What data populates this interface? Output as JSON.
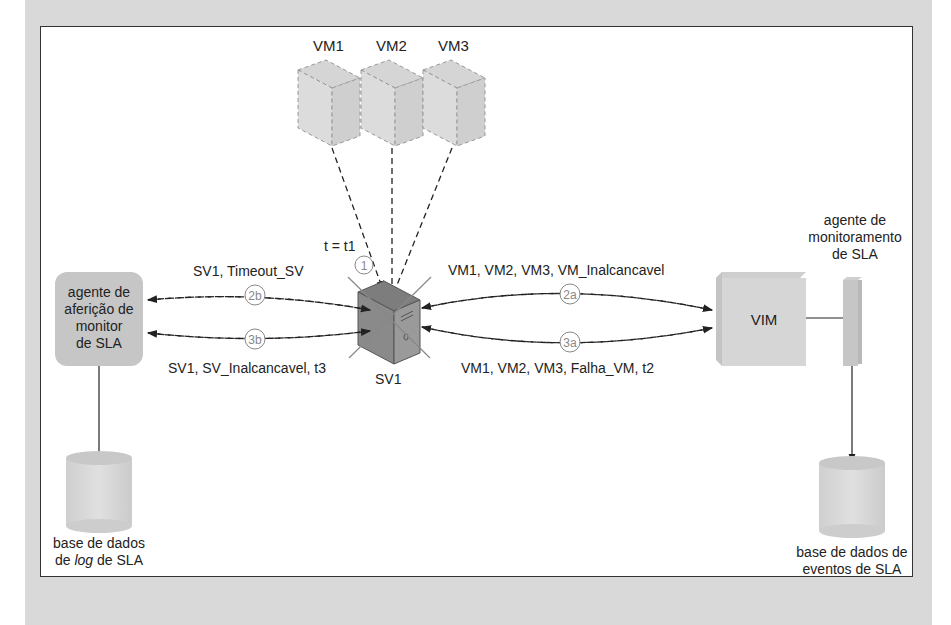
{
  "diagram": {
    "vms": [
      {
        "label": "VM1"
      },
      {
        "label": "VM2"
      },
      {
        "label": "VM3"
      }
    ],
    "server": {
      "label": "SV1",
      "time_label": "t = t1",
      "step": "1"
    },
    "left_agent": {
      "lines": [
        "agente de",
        "aferição de",
        "monitor",
        "de SLA"
      ]
    },
    "left_db": {
      "line1": "base de dados",
      "line2_prefix": "de ",
      "line2_italic": "log",
      "line2_suffix": " de SLA"
    },
    "vim": {
      "label": "VIM"
    },
    "right_agent": {
      "lines": [
        "agente de",
        "monitoramento",
        "de SLA"
      ]
    },
    "right_db": {
      "lines": [
        "base de dados de",
        "eventos de SLA"
      ]
    },
    "messages": {
      "m2b": {
        "step": "2b",
        "text": "SV1, Timeout_SV"
      },
      "m3b": {
        "step": "3b",
        "text": "SV1, SV_Inalcancavel, t3"
      },
      "m2a": {
        "step": "2a",
        "text": "VM1, VM2, VM3, VM_Inalcancavel"
      },
      "m3a": {
        "step": "3a",
        "text": "VM1, VM2, VM3, Falha_VM, t2"
      }
    }
  }
}
